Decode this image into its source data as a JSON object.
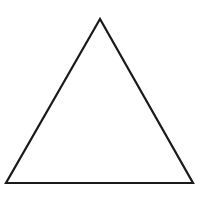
{
  "diagram": {
    "shape": "triangle",
    "kind": "equilateral-outline",
    "vertices": {
      "apex": [
        100,
        19
      ],
      "bottom_left": [
        6,
        183
      ],
      "bottom_right": [
        193,
        183
      ]
    },
    "stroke_color": "#1a1a1a",
    "stroke_width": 2.2,
    "fill_color": "#ffffff",
    "background_color": "#ffffff"
  }
}
